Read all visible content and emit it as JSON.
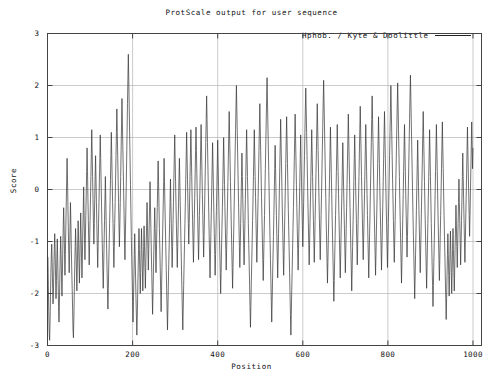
{
  "chart_data": {
    "type": "line",
    "title": "ProtScale output for user sequence",
    "xlabel": "Position",
    "ylabel": "Score",
    "xlim": [
      0,
      1020
    ],
    "ylim": [
      -3,
      3
    ],
    "grid": true,
    "legend_position": "top-right",
    "xticks": [
      0,
      200,
      400,
      600,
      800,
      1000
    ],
    "xtick_labels": [
      "0",
      "200",
      "400",
      "600",
      "800",
      "1000"
    ],
    "yticks": [
      -3,
      -2,
      -1,
      0,
      1,
      2,
      3
    ],
    "ytick_labels": [
      "-3",
      "-2",
      "-1",
      "0",
      "1",
      "2",
      "3"
    ],
    "line_color": "#333333",
    "grid_color": "#b4b4b4",
    "axis_color": "#444444",
    "background_color": "#ffffff",
    "series": [
      {
        "name": "Hphob. / Kyte & Doolittle",
        "x_start": 1,
        "x_step": 1,
        "n_points": 1000,
        "values": [
          -1.3,
          -1.85,
          -2.35,
          -2.75,
          -2.9,
          -2.55,
          -2.05,
          -1.6,
          -1.25,
          -1.05,
          -1.4,
          -1.9,
          -2.2,
          -1.95,
          -1.5,
          -1.15,
          -0.85,
          -1.2,
          -1.7,
          -2.1,
          -1.75,
          -1.3,
          -0.95,
          -1.35,
          -1.8,
          -2.25,
          -2.55,
          -2.2,
          -1.7,
          -1.25,
          -0.9,
          -1.25,
          -1.7,
          -2.05,
          -1.65,
          -1.15,
          -0.7,
          -0.35,
          -0.7,
          -1.2,
          -1.65,
          -1.25,
          -0.75,
          -0.3,
          0.15,
          0.6,
          0.2,
          -0.3,
          -0.8,
          -1.25,
          -1.6,
          -1.2,
          -0.7,
          -0.25,
          -0.65,
          -1.15,
          -1.55,
          -1.9,
          -2.3,
          -2.7,
          -2.85,
          -2.45,
          -1.95,
          -1.5,
          -1.1,
          -0.75,
          -1.1,
          -1.55,
          -1.95,
          -1.55,
          -1.05,
          -0.6,
          -0.95,
          -1.4,
          -1.8,
          -1.4,
          -0.9,
          -0.45,
          -0.85,
          -1.3,
          -1.7,
          -1.3,
          -0.8,
          -0.4,
          0.05,
          -0.45,
          -0.95,
          -1.35,
          -0.95,
          -0.5,
          -0.1,
          0.35,
          0.8,
          0.35,
          -0.15,
          -0.6,
          -1.05,
          -1.45,
          -1.05,
          -0.6,
          -0.2,
          0.25,
          0.7,
          1.15,
          0.7,
          0.25,
          -0.2,
          -0.65,
          -1.05,
          -0.65,
          -0.2,
          0.25,
          0.65,
          0.2,
          -0.25,
          -0.7,
          -1.1,
          -1.5,
          -1.1,
          -0.65,
          -0.25,
          0.2,
          0.6,
          1.05,
          0.6,
          0.15,
          -0.3,
          -0.75,
          -1.15,
          -1.55,
          -1.9,
          -1.5,
          -1.05,
          -0.6,
          -0.2,
          0.25,
          -0.2,
          -0.7,
          -1.15,
          -1.55,
          -1.95,
          -2.3,
          -1.9,
          -1.45,
          -1.05,
          -0.65,
          -0.25,
          0.2,
          0.65,
          1.1,
          0.65,
          0.2,
          -0.25,
          -0.65,
          -1.1,
          -1.5,
          -1.1,
          -0.65,
          -0.25,
          0.2,
          0.65,
          1.1,
          1.55,
          1.1,
          0.65,
          0.2,
          -0.25,
          -0.7,
          -1.1,
          -0.7,
          -0.25,
          0.25,
          0.75,
          1.25,
          1.75,
          1.3,
          0.85,
          0.4,
          -0.05,
          -0.5,
          -0.95,
          -1.35,
          -0.9,
          -0.45,
          0.05,
          0.55,
          1.1,
          1.65,
          2.15,
          2.6,
          2.1,
          1.6,
          1.1,
          0.6,
          0.1,
          -0.4,
          -0.9,
          -1.35,
          -1.75,
          -2.15,
          -2.55,
          -2.15,
          -1.7,
          -1.25,
          -0.85,
          -1.25,
          -1.7,
          -2.1,
          -2.45,
          -2.8,
          -2.45,
          -2.0,
          -1.55,
          -1.15,
          -0.75,
          -1.15,
          -1.6,
          -2.0,
          -1.6,
          -1.15,
          -0.75,
          -1.15,
          -1.55,
          -1.95,
          -1.55,
          -1.1,
          -0.7,
          -1.1,
          -1.5,
          -1.9,
          -1.5,
          -1.05,
          -0.65,
          -0.25,
          -0.7,
          -1.15,
          -1.55,
          -1.15,
          -0.7,
          -0.3,
          0.15,
          -0.3,
          -0.75,
          -1.2,
          -1.6,
          -2.0,
          -2.4,
          -2.0,
          -1.55,
          -1.15,
          -0.75,
          -0.35,
          -0.75,
          -1.2,
          -1.6,
          -1.2,
          -0.75,
          -0.35,
          0.1,
          0.55,
          0.15,
          -0.3,
          -0.75,
          -1.15,
          -1.55,
          -1.95,
          -2.35,
          -1.95,
          -1.5,
          -1.1,
          -0.7,
          -0.3,
          0.15,
          0.6,
          0.15,
          -0.3,
          -0.7,
          -1.1,
          -1.5,
          -1.9,
          -2.3,
          -2.7,
          -2.3,
          -1.85,
          -1.45,
          -1.05,
          -0.65,
          -0.25,
          0.2,
          -0.25,
          -0.7,
          -1.1,
          -1.5,
          -1.1,
          -0.65,
          -0.25,
          0.2,
          0.65,
          1.05,
          0.6,
          0.15,
          -0.3,
          -0.7,
          -1.1,
          -1.5,
          -1.1,
          -0.7,
          -0.25,
          0.2,
          0.6,
          0.15,
          -0.3,
          -0.7,
          -1.15,
          -1.55,
          -1.95,
          -2.35,
          -2.7,
          -2.3,
          -1.85,
          -1.45,
          -1.05,
          -0.65,
          -0.25,
          0.2,
          0.65,
          1.1,
          0.65,
          0.2,
          -0.25,
          -0.65,
          -1.05,
          -0.65,
          -0.2,
          0.25,
          0.7,
          1.15,
          0.7,
          0.25,
          -0.2,
          -0.6,
          -1.0,
          -1.4,
          -1.0,
          -0.55,
          -0.15,
          0.3,
          0.75,
          1.2,
          0.75,
          0.3,
          -0.15,
          -0.55,
          -0.95,
          -1.35,
          -0.95,
          -0.5,
          -0.1,
          0.35,
          0.8,
          1.25,
          0.8,
          0.35,
          -0.1,
          -0.5,
          -0.9,
          -1.3,
          -0.9,
          -0.45,
          0.0,
          0.45,
          0.9,
          1.35,
          1.8,
          1.35,
          0.9,
          0.45,
          0.0,
          -0.45,
          -0.9,
          -1.3,
          -1.7,
          -1.3,
          -0.85,
          -0.45,
          0.0,
          0.45,
          0.9,
          0.45,
          0.0,
          -0.45,
          -0.85,
          -1.25,
          -1.65,
          -1.25,
          -0.8,
          -0.4,
          0.05,
          0.5,
          0.95,
          0.5,
          0.05,
          -0.4,
          -0.8,
          -1.2,
          -1.6,
          -2.0,
          -1.6,
          -1.15,
          -0.75,
          -0.35,
          0.1,
          0.55,
          1.0,
          0.55,
          0.1,
          -0.35,
          -0.75,
          -1.15,
          -1.55,
          -1.15,
          -0.7,
          -0.3,
          0.15,
          0.6,
          1.05,
          1.5,
          1.05,
          0.6,
          0.15,
          -0.3,
          -0.7,
          -1.1,
          -1.5,
          -1.9,
          -1.5,
          -1.05,
          -0.65,
          -0.2,
          0.25,
          0.7,
          1.15,
          1.6,
          2.0,
          1.55,
          1.1,
          0.65,
          0.2,
          -0.25,
          -0.7,
          -1.1,
          -1.5,
          -1.1,
          -0.65,
          -0.2,
          0.25,
          0.7,
          0.25,
          -0.2,
          -0.65,
          -1.05,
          -1.45,
          -1.05,
          -0.6,
          -0.2,
          0.25,
          0.7,
          1.15,
          0.7,
          0.25,
          -0.2,
          -0.65,
          -1.05,
          -1.45,
          -1.85,
          -2.25,
          -2.65,
          -2.25,
          -1.8,
          -1.4,
          -1.0,
          -0.6,
          -0.2,
          0.25,
          0.7,
          1.15,
          0.7,
          0.25,
          -0.15,
          -0.6,
          -1.0,
          -1.4,
          -1.0,
          -0.55,
          -0.15,
          0.3,
          0.75,
          1.2,
          1.65,
          1.2,
          0.75,
          0.3,
          -0.15,
          -0.55,
          -0.95,
          -1.35,
          -1.75,
          -1.35,
          -0.9,
          -0.5,
          -0.05,
          0.4,
          0.85,
          1.3,
          1.75,
          2.15,
          1.7,
          1.25,
          0.8,
          0.35,
          -0.1,
          -0.55,
          -0.95,
          -1.35,
          -1.75,
          -2.15,
          -2.55,
          -2.15,
          -1.7,
          -1.3,
          -0.9,
          -0.5,
          -0.05,
          0.4,
          0.85,
          0.4,
          -0.05,
          -0.5,
          -0.9,
          -1.3,
          -1.7,
          -1.3,
          -0.85,
          -0.45,
          0.0,
          0.45,
          0.9,
          1.35,
          0.9,
          0.45,
          0.0,
          -0.45,
          -0.85,
          -1.25,
          -1.65,
          -1.25,
          -0.8,
          -0.4,
          0.05,
          0.5,
          0.95,
          1.4,
          0.95,
          0.5,
          0.05,
          -0.4,
          -0.8,
          -1.2,
          -1.6,
          -2.0,
          -2.4,
          -2.8,
          -2.4,
          -1.95,
          -1.55,
          -1.15,
          -0.75,
          -0.35,
          0.1,
          0.55,
          1.0,
          1.45,
          1.0,
          0.55,
          0.1,
          -0.35,
          -0.75,
          -1.15,
          -1.55,
          -1.15,
          -0.7,
          -0.3,
          0.15,
          0.6,
          1.05,
          0.6,
          0.15,
          -0.3,
          -0.7,
          -1.1,
          -0.7,
          -0.25,
          0.2,
          0.65,
          1.1,
          1.55,
          1.95,
          1.55,
          1.1,
          0.65,
          0.2,
          -0.25,
          -0.65,
          -1.05,
          -1.45,
          -1.05,
          -0.6,
          -0.2,
          0.25,
          0.7,
          1.15,
          0.7,
          0.25,
          -0.2,
          -0.6,
          -1.0,
          -1.4,
          -1.0,
          -0.55,
          -0.15,
          0.3,
          0.75,
          1.2,
          1.65,
          1.2,
          0.75,
          0.3,
          -0.15,
          -0.55,
          -0.95,
          -1.35,
          -0.95,
          -0.5,
          -0.1,
          0.35,
          0.8,
          1.25,
          1.7,
          2.1,
          1.65,
          1.2,
          0.75,
          0.3,
          -0.15,
          -0.6,
          -1.0,
          -1.4,
          -1.8,
          -1.4,
          -0.95,
          -0.55,
          -0.15,
          0.3,
          0.75,
          1.2,
          0.75,
          0.3,
          -0.1,
          -0.55,
          -0.95,
          -1.35,
          -1.75,
          -2.15,
          -1.75,
          -1.3,
          -0.9,
          -0.5,
          -0.1,
          0.35,
          0.8,
          1.25,
          0.8,
          0.35,
          -0.1,
          -0.5,
          -0.9,
          -1.3,
          -1.7,
          -1.3,
          -0.85,
          -0.45,
          0.0,
          0.45,
          0.9,
          0.45,
          0.0,
          -0.4,
          -0.8,
          -1.2,
          -1.6,
          -1.2,
          -0.75,
          -0.35,
          0.1,
          0.55,
          1.0,
          1.45,
          1.0,
          0.55,
          0.1,
          -0.35,
          -0.75,
          -1.15,
          -1.55,
          -1.95,
          -1.55,
          -1.1,
          -0.7,
          -0.3,
          0.15,
          0.6,
          1.05,
          0.6,
          0.15,
          -0.25,
          -0.65,
          -1.05,
          -1.45,
          -1.05,
          -0.6,
          -0.2,
          0.25,
          0.7,
          1.15,
          1.6,
          1.15,
          0.7,
          0.25,
          -0.15,
          -0.55,
          -0.95,
          -1.35,
          -0.95,
          -0.55,
          -0.1,
          0.35,
          0.8,
          1.25,
          0.8,
          0.35,
          -0.1,
          -0.5,
          -0.9,
          -1.3,
          -1.7,
          -1.3,
          -0.85,
          -0.45,
          0.0,
          0.45,
          0.9,
          1.35,
          1.8,
          1.35,
          0.9,
          0.45,
          0.0,
          -0.45,
          -0.85,
          -1.25,
          -1.65,
          -1.25,
          -0.8,
          -0.4,
          0.05,
          0.5,
          0.95,
          1.4,
          0.95,
          0.5,
          0.05,
          -0.35,
          -0.75,
          -1.15,
          -1.55,
          -1.15,
          -0.7,
          -0.3,
          0.15,
          0.6,
          1.05,
          1.5,
          1.05,
          0.6,
          0.15,
          -0.3,
          -0.7,
          -1.1,
          -1.5,
          -1.1,
          -0.65,
          -0.25,
          0.2,
          0.65,
          1.1,
          1.55,
          2.0,
          1.55,
          1.1,
          0.65,
          0.2,
          -0.2,
          -0.6,
          -1.0,
          -1.4,
          -1.0,
          -0.6,
          -0.15,
          0.3,
          0.75,
          1.2,
          1.65,
          2.05,
          1.6,
          1.15,
          0.7,
          0.25,
          -0.2,
          -0.6,
          -1.0,
          -1.4,
          -1.8,
          -1.4,
          -0.95,
          -0.55,
          -0.1,
          0.35,
          0.8,
          1.25,
          0.8,
          0.35,
          -0.1,
          -0.5,
          -0.9,
          -1.3,
          -0.9,
          -0.45,
          0.0,
          0.45,
          0.9,
          1.35,
          1.8,
          2.2,
          1.75,
          1.3,
          0.85,
          0.4,
          -0.05,
          -0.5,
          -0.9,
          -1.3,
          -1.7,
          -2.1,
          -1.7,
          -1.25,
          -0.85,
          -0.4,
          0.05,
          0.5,
          0.95,
          0.5,
          0.05,
          -0.4,
          -0.8,
          -1.2,
          -1.6,
          -1.2,
          -0.75,
          -0.3,
          0.15,
          0.6,
          1.05,
          1.5,
          1.05,
          0.6,
          0.15,
          -0.3,
          -0.7,
          -1.1,
          -1.5,
          -1.9,
          -1.5,
          -1.05,
          -0.65,
          -0.2,
          0.25,
          0.7,
          1.15,
          0.7,
          0.25,
          -0.2,
          -0.65,
          -1.05,
          -1.45,
          -1.85,
          -2.25,
          -1.85,
          -1.4,
          -1.0,
          -0.55,
          -0.1,
          0.35,
          0.8,
          1.25,
          0.8,
          0.35,
          -0.1,
          -0.55,
          -0.95,
          -1.35,
          -1.75,
          -1.35,
          -0.9,
          -0.5,
          -0.05,
          0.4,
          0.85,
          1.3,
          0.85,
          0.4,
          -0.05,
          -0.5,
          -0.9,
          -1.3,
          -1.7,
          -2.1,
          -2.5,
          -2.1,
          -1.65,
          -1.25,
          -0.85,
          -1.25,
          -1.65,
          -2.05,
          -1.65,
          -1.2,
          -0.8,
          -1.2,
          -1.6,
          -2.0,
          -1.6,
          -1.15,
          -0.75,
          -1.15,
          -1.55,
          -1.95,
          -1.55,
          -1.1,
          -0.7,
          -0.3,
          -0.7,
          -1.1,
          -1.5,
          -1.1,
          -0.65,
          -0.25,
          0.2,
          -0.25,
          -0.65,
          -1.05,
          -1.45,
          -1.05,
          -0.6,
          -0.2,
          0.25,
          0.7,
          0.25,
          -0.2,
          -0.6,
          -1.0,
          -1.4,
          -1.0,
          -0.55,
          -0.15,
          0.3,
          0.75,
          1.2,
          0.75,
          0.3,
          -0.1,
          -0.5,
          -0.9,
          -0.5,
          -0.05,
          0.4,
          0.85,
          1.3,
          0.85,
          0.4,
          0.8
        ]
      }
    ]
  }
}
